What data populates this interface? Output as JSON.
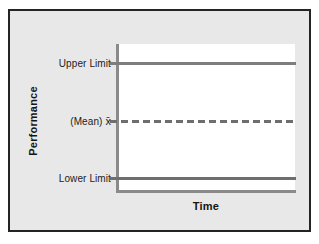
{
  "chart_data": {
    "type": "line",
    "title": "",
    "subtitle": "",
    "xlabel": "Time",
    "ylabel": "Performance",
    "grid": false,
    "legend": "none",
    "xlim": [
      0,
      1
    ],
    "ylim": [
      0,
      1
    ],
    "x_tick_labels": [],
    "y_tick_labels": [
      "Upper Limit",
      "(Mean) x̄",
      "Lower Limit"
    ],
    "annotations": [],
    "series": [
      {
        "name": "Upper Limit",
        "style": "solid",
        "color": "#7d7d7d",
        "level": 0.87,
        "values": [
          0.87,
          0.87
        ]
      },
      {
        "name": "(Mean) x̄",
        "style": "dashed",
        "color": "#6e6e6e",
        "level": 0.48,
        "values": [
          0.48,
          0.48
        ]
      },
      {
        "name": "Lower Limit",
        "style": "solid",
        "color": "#6e6e6e",
        "level": 0.09,
        "values": [
          0.09,
          0.09
        ]
      }
    ]
  },
  "axes": {
    "y_title": "Performance",
    "x_title": "Time"
  },
  "labels": {
    "upper_limit": "Upper Limit",
    "mean": "(Mean) x̄",
    "mean_prefix": "(Mean)",
    "mean_symbol": "x̄",
    "lower_limit": "Lower Limit"
  },
  "colors": {
    "background": "#e8e8e8",
    "panel_border": "#242424",
    "plot_background": "#ffffff",
    "axis_line": "#8a8a8a",
    "upper_limit_line": "#7d7d7d",
    "mean_line": "#6e6e6e",
    "lower_limit_line": "#6e6e6e",
    "text": "#1c1c1c"
  }
}
